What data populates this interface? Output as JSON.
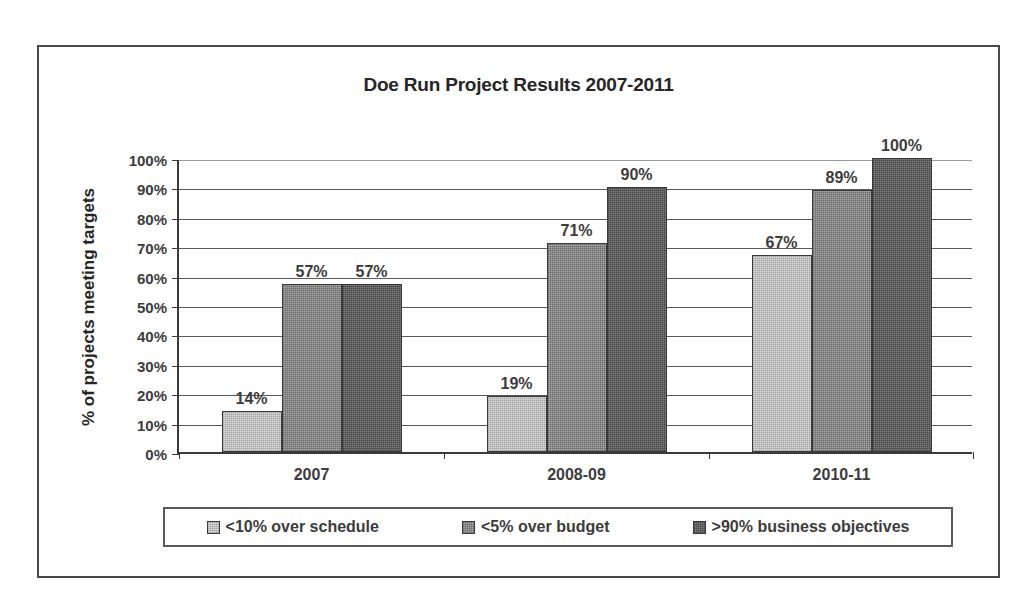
{
  "chart_data": {
    "type": "bar",
    "title": "Doe Run Project Results 2007-2011",
    "xlabel": "",
    "ylabel": "% of projects meeting targets",
    "categories": [
      "2007",
      "2008-09",
      "2010-11"
    ],
    "series": [
      {
        "name": "<10% over schedule",
        "values": [
          14,
          19,
          67
        ],
        "labels": [
          "14%",
          "19%",
          "67%"
        ],
        "color": "#dcdcdc"
      },
      {
        "name": "<5% over budget",
        "values": [
          57,
          71,
          89
        ],
        "labels": [
          "57%",
          "71%",
          "89%"
        ],
        "color": "#a8a8a8"
      },
      {
        "name": ">90% business objectives",
        "values": [
          57,
          90,
          100
        ],
        "labels": [
          "57%",
          "90%",
          "100%"
        ],
        "color": "#7c7c7c"
      }
    ],
    "ylim": [
      0,
      100
    ],
    "ytick_labels": [
      "100%",
      "90%",
      "80%",
      "70%",
      "60%",
      "50%",
      "40%",
      "30%",
      "20%",
      "10%",
      "0%"
    ],
    "ytick_values": [
      100,
      90,
      80,
      70,
      60,
      50,
      40,
      30,
      20,
      10,
      0
    ],
    "grid": true,
    "legend_position": "bottom",
    "value_labels_shown": true
  },
  "legend": {
    "items": [
      {
        "label": "<10% over schedule"
      },
      {
        "label": "<5% over budget"
      },
      {
        "label": ">90% business objectives"
      }
    ]
  }
}
